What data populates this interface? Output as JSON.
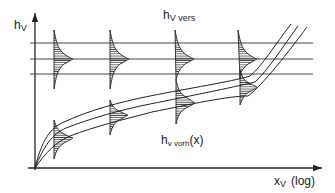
{
  "diagram": {
    "y_axis_label": {
      "main": "h",
      "sub": "V"
    },
    "x_axis_label": {
      "main": "x",
      "sub": "V",
      "suffix": "(log)"
    },
    "upper_label": {
      "main": "h",
      "sub": "V vers"
    },
    "lower_label": {
      "main": "h",
      "sub": "v vorh",
      "suffix": "(x)"
    },
    "horizontal_lines_y": [
      43,
      59,
      74
    ],
    "distribution_columns": [
      {
        "x": 55,
        "upper_center_y": 59,
        "lower_center_y": 138
      },
      {
        "x": 110,
        "upper_center_y": 59,
        "lower_center_y": 115
      },
      {
        "x": 176,
        "upper_center_y": 59,
        "lower_center_y": 103
      },
      {
        "x": 240,
        "upper_center_y": 59,
        "lower_center_y": 87
      }
    ],
    "curve_count": 3,
    "colors": {
      "line": "#222222",
      "hatch": "#333333"
    }
  }
}
